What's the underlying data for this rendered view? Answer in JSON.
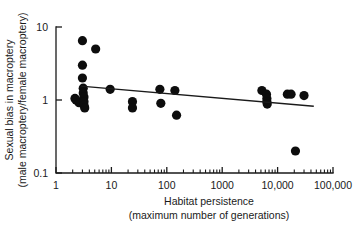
{
  "chart_data": {
    "type": "scatter",
    "title": "",
    "xlabel": "Habitat persistence",
    "xlabel_line2": "(maximum number of generations)",
    "ylabel": "Sexual bias in macroptery",
    "ylabel_line2": "(male macroptery/female macroptery)",
    "xscale": "log",
    "yscale": "log",
    "xlim": [
      1,
      100000
    ],
    "ylim": [
      0.1,
      10
    ],
    "grid": false,
    "legend": null,
    "xticks": [
      1,
      10,
      100,
      1000,
      10000,
      100000
    ],
    "xtick_labels": [
      "1",
      "10",
      "100",
      "1000",
      "10,000",
      "100,000"
    ],
    "yticks": [
      0.1,
      1,
      10
    ],
    "ytick_labels": [
      "0.1",
      "1",
      "10"
    ],
    "minor_ticks": true,
    "points": [
      {
        "x": 2.2,
        "y": 1.05
      },
      {
        "x": 2.3,
        "y": 1.0
      },
      {
        "x": 2.6,
        "y": 0.92
      },
      {
        "x": 3.0,
        "y": 6.5
      },
      {
        "x": 3.0,
        "y": 3.0
      },
      {
        "x": 3.0,
        "y": 2.0
      },
      {
        "x": 3.1,
        "y": 1.45
      },
      {
        "x": 3.1,
        "y": 1.25
      },
      {
        "x": 3.2,
        "y": 1.1
      },
      {
        "x": 3.2,
        "y": 0.95
      },
      {
        "x": 3.2,
        "y": 0.85
      },
      {
        "x": 3.3,
        "y": 0.78
      },
      {
        "x": 5.2,
        "y": 5.0
      },
      {
        "x": 9.5,
        "y": 1.4
      },
      {
        "x": 24,
        "y": 0.95
      },
      {
        "x": 24,
        "y": 0.78
      },
      {
        "x": 75,
        "y": 1.4
      },
      {
        "x": 78,
        "y": 0.9
      },
      {
        "x": 140,
        "y": 1.35
      },
      {
        "x": 150,
        "y": 0.62
      },
      {
        "x": 5200,
        "y": 1.35
      },
      {
        "x": 6300,
        "y": 1.2
      },
      {
        "x": 6400,
        "y": 1.05
      },
      {
        "x": 6400,
        "y": 0.95
      },
      {
        "x": 6500,
        "y": 0.88
      },
      {
        "x": 15000,
        "y": 1.2
      },
      {
        "x": 17500,
        "y": 1.2
      },
      {
        "x": 21000,
        "y": 0.2
      },
      {
        "x": 30000,
        "y": 1.15
      }
    ],
    "trendline": {
      "x_start": 2.8,
      "y_start": 1.55,
      "x_end": 45000,
      "y_end": 0.82
    },
    "series": [
      {
        "name": "Species data",
        "marker": "filled-circle",
        "marker_color": "#0d0d0d",
        "marker_size": 4.6
      }
    ],
    "colors": {
      "axis": "#1a1a1a",
      "marker": "#0d0d0d",
      "trendline": "#1a1a1a",
      "background": "#ffffff"
    }
  }
}
